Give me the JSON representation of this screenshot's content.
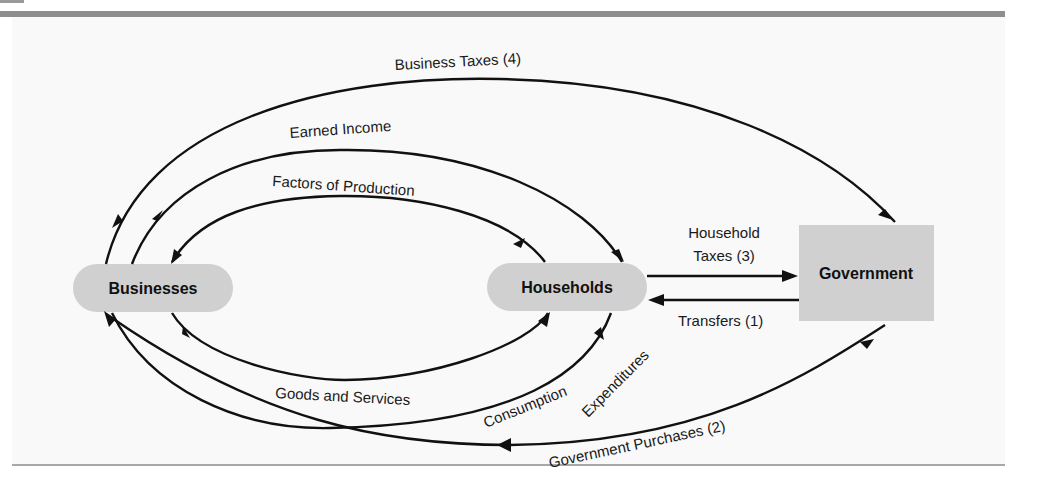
{
  "figure": {
    "type": "circular-flow-diagram",
    "colors": {
      "node_fill": "#d0d0d0",
      "panel_bg": "#f9f9f9",
      "rule": "#8e8e8e",
      "line": "#111111"
    }
  },
  "nodes": {
    "businesses": {
      "label": "Businesses",
      "shape": "rounded-pill"
    },
    "households": {
      "label": "Households",
      "shape": "rounded-pill"
    },
    "government": {
      "label": "Government",
      "shape": "rectangle"
    }
  },
  "flows": [
    {
      "id": "business_taxes",
      "label": "Business Taxes (4)",
      "from": "Businesses",
      "to": "Government"
    },
    {
      "id": "earned_income",
      "label": "Earned Income",
      "from": "Businesses",
      "to": "Households"
    },
    {
      "id": "factors_of_production",
      "label": "Factors of Production",
      "from": "Households",
      "to": "Businesses"
    },
    {
      "id": "household_taxes",
      "label_line1": "Household",
      "label_line2": "Taxes (3)",
      "from": "Households",
      "to": "Government"
    },
    {
      "id": "transfers",
      "label": "Transfers (1)",
      "from": "Government",
      "to": "Households"
    },
    {
      "id": "goods_and_services",
      "label": "Goods and Services",
      "from": "Businesses",
      "to": "Households"
    },
    {
      "id": "consumption_expenditures",
      "label_line1": "Consumption",
      "label_line2": "Expenditures",
      "from": "Households",
      "to": "Businesses"
    },
    {
      "id": "government_purchases",
      "label": "Government Purchases (2)",
      "from": "Government",
      "to": "Businesses"
    }
  ]
}
